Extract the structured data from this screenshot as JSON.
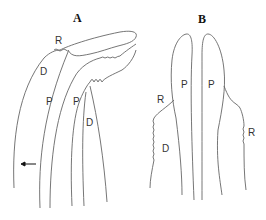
{
  "figure": {
    "panels": [
      {
        "id": "A",
        "label": "A",
        "labels": {
          "r": "R",
          "d1": "D",
          "p1": "P",
          "p2": "P",
          "d2": "D"
        }
      },
      {
        "id": "B",
        "label": "B",
        "labels": {
          "r1": "R",
          "p1": "P",
          "p2": "P",
          "d": "D",
          "r2": "R"
        }
      }
    ],
    "arrow": "left-arrow",
    "line_color": "#555555"
  }
}
